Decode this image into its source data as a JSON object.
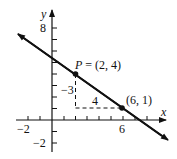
{
  "axes": {
    "x_label": "x",
    "y_label": "y",
    "x_tick_labels": [
      {
        "value": -2,
        "text": "−2"
      },
      {
        "value": 6,
        "text": "6"
      }
    ],
    "y_tick_labels": [
      {
        "value": 8,
        "text": "8"
      },
      {
        "value": -2,
        "text": "−2"
      }
    ],
    "x_range": [
      -3,
      9
    ],
    "y_range": [
      -3,
      9
    ]
  },
  "line": {
    "slope": -0.75,
    "description": "line through (2,4) and (6,1)"
  },
  "points": [
    {
      "name": "P",
      "label": "P = (2, 4)",
      "label_prefix": "P",
      "label_rest": " = (2, 4)",
      "x": 2,
      "y": 4
    },
    {
      "label": "(6, 1)",
      "x": 6,
      "y": 1
    }
  ],
  "slope_triangle": {
    "rise_label": "−3",
    "run_label": "4"
  },
  "colors": {
    "ink": "#111111",
    "background": "#ffffff"
  }
}
